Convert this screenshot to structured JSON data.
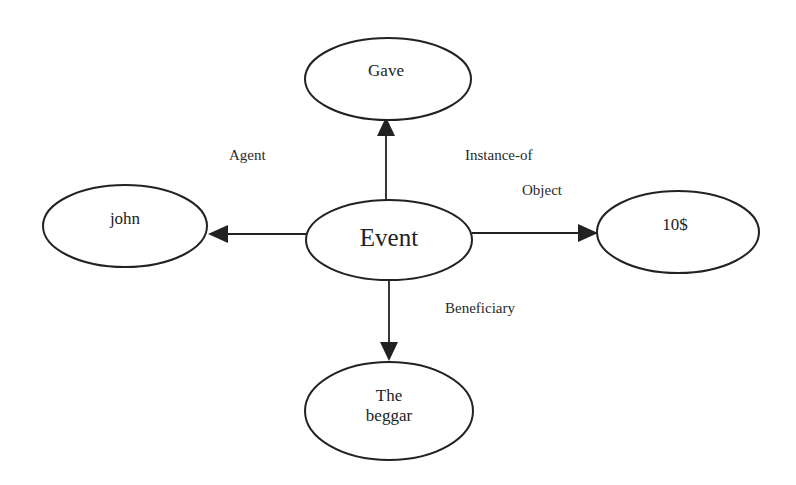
{
  "diagram": {
    "type": "semantic-network",
    "nodes": [
      {
        "id": "event",
        "label": "Event",
        "cx": 389,
        "cy": 240,
        "rx": 83,
        "ry": 40,
        "size": "large"
      },
      {
        "id": "gave",
        "label": "Gave",
        "cx": 388,
        "cy": 79,
        "rx": 83,
        "ry": 41,
        "size": "small"
      },
      {
        "id": "john",
        "label": "john",
        "cx": 125,
        "cy": 226,
        "rx": 82,
        "ry": 41,
        "size": "small"
      },
      {
        "id": "ten-dollars",
        "label": "10$",
        "cx": 678,
        "cy": 232,
        "rx": 81,
        "ry": 41,
        "size": "small"
      },
      {
        "id": "the-beggar",
        "label": "The\nbeggar",
        "cx": 389,
        "cy": 411,
        "rx": 84,
        "ry": 49,
        "size": "small"
      }
    ],
    "edges": [
      {
        "from": "event",
        "to": "gave",
        "label": "Instance-of"
      },
      {
        "from": "event",
        "to": "john",
        "label": "Agent"
      },
      {
        "from": "event",
        "to": "ten-dollars",
        "label": "Object"
      },
      {
        "from": "event",
        "to": "the-beggar",
        "label": "Beneficiary"
      }
    ],
    "edge_labels": {
      "agent": "Agent",
      "instance_of": "Instance-of",
      "object": "Object",
      "beneficiary": "Beneficiary"
    },
    "node_labels": {
      "event": "Event",
      "gave": "Gave",
      "john": "john",
      "ten_dollars": "10$",
      "the_beggar": "The\nbeggar"
    }
  }
}
